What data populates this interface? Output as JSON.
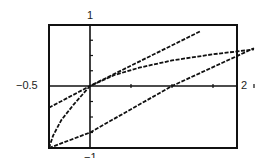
{
  "chart_data": {
    "type": "line",
    "title": "",
    "xlabel": "",
    "ylabel": "",
    "xlim": [
      -0.5,
      2
    ],
    "ylim": [
      -1,
      1
    ],
    "grid": false,
    "tick_labels": {
      "x_min": "−0.5",
      "x_max": "2",
      "y_max": "1",
      "y_min": "−1"
    },
    "series": [
      {
        "name": "line-upper",
        "style": "dashed",
        "points": [
          [
            -0.5,
            -0.35
          ],
          [
            0,
            0
          ],
          [
            1.35,
            0.9
          ]
        ]
      },
      {
        "name": "curve",
        "style": "dashed",
        "points": [
          [
            -0.5,
            -1.0
          ],
          [
            -0.45,
            -0.8
          ],
          [
            -0.35,
            -0.55
          ],
          [
            -0.2,
            -0.3
          ],
          [
            0,
            0
          ],
          [
            0.3,
            0.18
          ],
          [
            0.6,
            0.3
          ],
          [
            1.0,
            0.42
          ],
          [
            1.5,
            0.52
          ],
          [
            2.0,
            0.6
          ]
        ]
      },
      {
        "name": "line-lower",
        "style": "dashed",
        "points": [
          [
            -0.5,
            -1.0
          ],
          [
            0,
            -0.75
          ],
          [
            1.0,
            0.0
          ],
          [
            2.0,
            0.62
          ]
        ]
      }
    ],
    "x_ticks": [
      0.5,
      1.0,
      1.5,
      2.0
    ],
    "y_ticks": [
      -0.75,
      -0.5,
      -0.25,
      0.25,
      0.5,
      0.75
    ]
  },
  "colors": {
    "axis": "#111111",
    "curve": "#111111",
    "background": "#ffffff"
  }
}
